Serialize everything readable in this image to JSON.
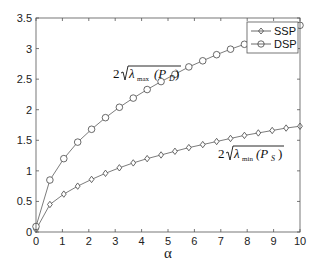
{
  "chart_data": {
    "type": "line",
    "title": "",
    "xlabel": "α",
    "ylabel": "",
    "xlim": [
      0,
      10
    ],
    "ylim": [
      0,
      3.5
    ],
    "grid": false,
    "legend_position": "upper right",
    "x_ticks": [
      "0",
      "1",
      "2",
      "3",
      "4",
      "5",
      "6",
      "7",
      "8",
      "9",
      "10"
    ],
    "y_ticks": [
      "0",
      "0.5",
      "1",
      "1.5",
      "2",
      "2.5",
      "3",
      "3.5"
    ],
    "x": [
      0,
      0.526,
      1.053,
      1.579,
      2.105,
      2.632,
      3.158,
      3.684,
      4.211,
      4.737,
      5.263,
      5.789,
      6.316,
      6.842,
      7.368,
      7.895,
      8.421,
      8.947,
      9.474,
      10
    ],
    "series": [
      {
        "name": "SSP",
        "marker": "diamond",
        "values": [
          0.04,
          0.45,
          0.62,
          0.75,
          0.86,
          0.96,
          1.05,
          1.13,
          1.2,
          1.26,
          1.32,
          1.38,
          1.43,
          1.48,
          1.53,
          1.58,
          1.62,
          1.66,
          1.7,
          1.73
        ]
      },
      {
        "name": "DSP",
        "marker": "circle",
        "values": [
          0.09,
          0.85,
          1.2,
          1.47,
          1.68,
          1.87,
          2.04,
          2.19,
          2.33,
          2.46,
          2.58,
          2.7,
          2.8,
          2.9,
          2.99,
          3.07,
          3.1,
          3.18,
          3.25,
          3.38
        ]
      }
    ],
    "annotations": [
      {
        "text_prefix": "2",
        "symbol": "λ",
        "subscript": "max",
        "argument": "(P",
        "arg_subscript": "D",
        "arg_close": ")",
        "near_series": "DSP",
        "x": 3.2,
        "y": 2.7
      },
      {
        "text_prefix": "2",
        "symbol": "λ",
        "subscript": "min",
        "argument": "(P",
        "arg_subscript": "S",
        "arg_close": ")",
        "near_series": "SSP",
        "x": 6.7,
        "y": 1.7
      }
    ]
  },
  "legend": {
    "items": [
      {
        "label": "SSP",
        "marker": "diamond"
      },
      {
        "label": "DSP",
        "marker": "circle"
      }
    ]
  },
  "colors": {
    "axis": "#555555",
    "line": "#444444",
    "marker": "#444444",
    "background": "#ffffff"
  }
}
